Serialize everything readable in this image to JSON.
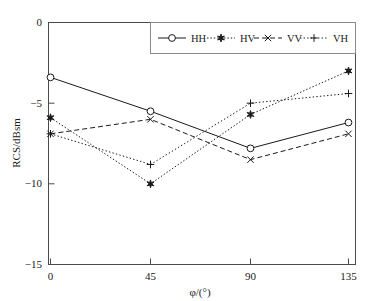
{
  "chart_data": {
    "type": "line",
    "title": "",
    "xlabel": "φ/(°)",
    "ylabel": "RCS/dBsm",
    "x": [
      0,
      45,
      90,
      135
    ],
    "categories": [
      "0",
      "45",
      "90",
      "135"
    ],
    "xticks": [
      "0",
      "45",
      "90",
      "135"
    ],
    "yticks": [
      "0",
      "−5",
      "−10",
      "−15"
    ],
    "xlim": [
      -7,
      150
    ],
    "ylim": [
      -15,
      0
    ],
    "grid": false,
    "legend_position": "top-right",
    "series": [
      {
        "name": "HH",
        "values": [
          -3.4,
          -5.5,
          -7.8,
          -6.2
        ],
        "linestyle": "solid",
        "marker": "circle-open"
      },
      {
        "name": "HV",
        "values": [
          -5.9,
          -10.0,
          -5.7,
          -3.0
        ],
        "linestyle": "dashdot",
        "marker": "star-filled"
      },
      {
        "name": "VV",
        "values": [
          -6.9,
          -6.0,
          -8.5,
          -6.9
        ],
        "linestyle": "dashed",
        "marker": "x"
      },
      {
        "name": "VH",
        "values": [
          -6.9,
          -8.8,
          -5.0,
          -4.4
        ],
        "linestyle": "dotted",
        "marker": "plus"
      }
    ]
  },
  "axes": {
    "y_title": "RCS/dBsm",
    "x_title": "φ/(°)",
    "x_tick_labels": [
      "0",
      "45",
      "90",
      "135"
    ],
    "y_tick_labels": [
      "0",
      "−5",
      "−10",
      "−15"
    ]
  },
  "legend": {
    "entries": [
      {
        "label": "HH"
      },
      {
        "label": "HV"
      },
      {
        "label": "VV"
      },
      {
        "label": "VH"
      }
    ]
  },
  "colors": {
    "line": "#1a1a1a",
    "frame": "#4a4a4a",
    "background": "#ffffff",
    "legend_border": "#8a8a8a"
  }
}
